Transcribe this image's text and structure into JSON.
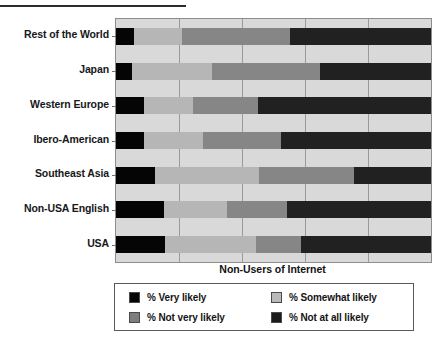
{
  "chart_data": {
    "type": "bar",
    "orientation": "horizontal",
    "stacked": true,
    "title": "",
    "xlabel": "Non-Users of Internet",
    "ylabel": "",
    "xlim": [
      0,
      100
    ],
    "grid": true,
    "gridlines": [
      0,
      20,
      40,
      60,
      80,
      100
    ],
    "legend_position": "bottom",
    "categories": [
      "Rest of the World",
      "Japan",
      "Western Europe",
      "Ibero-American",
      "Southeast Asia",
      "Non-USA English",
      "USA"
    ],
    "series": [
      {
        "name": "% Very likely",
        "color": "#050505",
        "values": [
          5.8,
          5.0,
          9.0,
          9.0,
          12.5,
          15.1,
          15.7
        ]
      },
      {
        "name": "% Somewhat likely",
        "color": "#b6b6b6",
        "values": [
          15.0,
          25.4,
          15.6,
          18.7,
          33.0,
          20.1,
          28.6
        ]
      },
      {
        "name": "% Not very likely",
        "color": "#868686",
        "values": [
          34.3,
          34.4,
          20.4,
          24.7,
          30.2,
          19.0,
          14.5
        ]
      },
      {
        "name": "% Not at all likely",
        "color": "#212121",
        "values": [
          44.9,
          35.2,
          55.0,
          47.6,
          24.3,
          45.8,
          41.2
        ]
      }
    ]
  },
  "axis_title": "Non-Users of Internet",
  "legend": {
    "items": [
      {
        "label": "% Very likely",
        "swatch": "sw-very"
      },
      {
        "label": "% Somewhat likely",
        "swatch": "sw-somewhat"
      },
      {
        "label": "% Not very likely",
        "swatch": "sw-notvery"
      },
      {
        "label": "% Not at all likely",
        "swatch": "sw-notatall"
      }
    ]
  }
}
